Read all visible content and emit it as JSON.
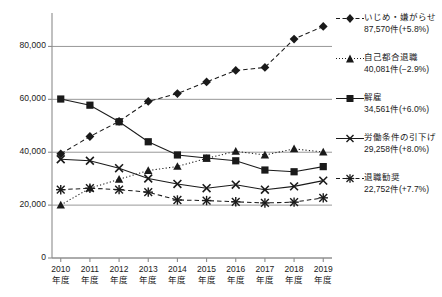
{
  "chart_data": {
    "type": "line",
    "title": "",
    "xlabel": "",
    "ylabel": "",
    "ylim": [
      0,
      90000
    ],
    "grid": true,
    "legend_position": "right",
    "categories": [
      "2010\n年度",
      "2011\n年度",
      "2012\n年度",
      "2013\n年度",
      "2014\n年度",
      "2015\n年度",
      "2016\n年度",
      "2017\n年度",
      "2018\n年度",
      "2019\n年度"
    ],
    "x_tick_years": [
      "2010",
      "2011",
      "2012",
      "2013",
      "2014",
      "2015",
      "2016",
      "2017",
      "2018",
      "2019"
    ],
    "x_tick_suffix": "年度",
    "y_ticks": [
      "0",
      "20,000",
      "40,000",
      "60,000",
      "80,000"
    ],
    "y_tick_values": [
      0,
      20000,
      40000,
      60000,
      80000
    ],
    "series": [
      {
        "name": "いじめ・嫌がらせ",
        "value_label": "87,570件(+5.8%)",
        "marker": "diamond",
        "line_style": "dashed",
        "values": [
          39405,
          45939,
          51670,
          59197,
          62191,
          66566,
          70917,
          72067,
          82797,
          87570
        ]
      },
      {
        "name": "自己都合退職",
        "value_label": "40,081件(−2.9%)",
        "marker": "triangle",
        "line_style": "dotted",
        "values": [
          20040,
          26392,
          29763,
          33049,
          34626,
          37648,
          40364,
          38954,
          41258,
          40081
        ]
      },
      {
        "name": "解雇",
        "value_label": "34,561件(+6.0%)",
        "marker": "square",
        "line_style": "solid",
        "values": [
          60118,
          57785,
          51515,
          43956,
          38966,
          37787,
          36760,
          33269,
          32614,
          34561
        ]
      },
      {
        "name": "労働条件の引下げ",
        "value_label": "29,258件(+8.0%)",
        "marker": "cross",
        "line_style": "solid",
        "values": [
          37334,
          36783,
          33955,
          30067,
          28015,
          26392,
          27723,
          25841,
          27082,
          29258
        ]
      },
      {
        "name": "退職勧奨",
        "value_label": "22,752件(+7.7%)",
        "marker": "asterisk",
        "line_style": "dashed",
        "values": [
          25829,
          26392,
          25838,
          24901,
          21928,
          21727,
          21244,
          20820,
          21125,
          22752
        ]
      }
    ]
  },
  "legend": {
    "items": [
      {
        "label": "いじめ・嫌がらせ",
        "value": "87,570件(+5.8%)"
      },
      {
        "label": "自己都合退職",
        "value": "40,081件(−2.9%)"
      },
      {
        "label": "解雇",
        "value": "34,561件(+6.0%)"
      },
      {
        "label": "労働条件の引下げ",
        "value": "29,258件(+8.0%)"
      },
      {
        "label": "退職勧奨",
        "value": "22,752件(+7.7%)"
      }
    ]
  },
  "colors": {
    "line": "#1a1a1a",
    "grid": "#8c8c8c",
    "axis": "#8c8c8c",
    "text": "#1a1a1a",
    "background": "#ffffff"
  }
}
